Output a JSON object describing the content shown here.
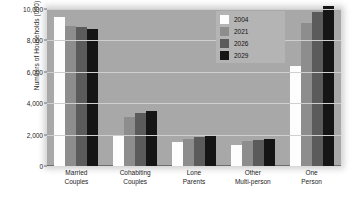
{
  "chart_data": {
    "type": "bar",
    "title": "",
    "xlabel": "",
    "ylabel": "Numbers of Households (000)",
    "ylim": [
      0,
      10000
    ],
    "yticks": [
      "0",
      "2,000",
      "4,000",
      "6,000",
      "8,000",
      "10,000"
    ],
    "ytick_values": [
      0,
      2000,
      4000,
      6000,
      8000,
      10000
    ],
    "grid": true,
    "legend_position": "top-right",
    "categories": [
      "Married Couples",
      "Cohabiting Couples",
      "Lone Parents",
      "Other Multi-person",
      "One Person"
    ],
    "category_lines": [
      [
        "Married",
        "Couples"
      ],
      [
        "Cohabiting",
        "Couples"
      ],
      [
        "Lone",
        "Parents"
      ],
      [
        "Other",
        "Multi-person"
      ],
      [
        "One",
        "Person"
      ]
    ],
    "series": [
      {
        "name": "2004",
        "color": "#fdfdfd",
        "values": [
          9500,
          2000,
          1550,
          1350,
          6400
        ]
      },
      {
        "name": "2021",
        "color": "#8d8d8d",
        "values": [
          8900,
          3150,
          1750,
          1600,
          9100
        ]
      },
      {
        "name": "2026",
        "color": "#5b5b5b",
        "values": [
          8850,
          3350,
          1850,
          1650,
          9800
        ]
      },
      {
        "name": "2029",
        "color": "#151515",
        "values": [
          8750,
          3500,
          1900,
          1700,
          10200
        ]
      }
    ]
  },
  "legend": {
    "items": [
      {
        "label": "2004"
      },
      {
        "label": "2021"
      },
      {
        "label": "2026"
      },
      {
        "label": "2029"
      }
    ]
  },
  "colors": {
    "plot_background": "#a8a8a8",
    "gridline": "#cfcfcf",
    "axis": "#6e6e6e",
    "legend_background": "#b4b4b4",
    "page_background": "#ffffff"
  }
}
